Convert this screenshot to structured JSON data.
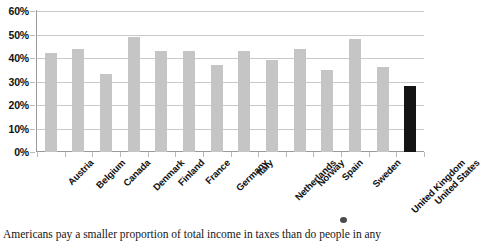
{
  "chart_data": {
    "type": "bar",
    "title": "",
    "subtitle": "",
    "xlabel": "",
    "ylabel": "",
    "ylim": [
      0,
      60
    ],
    "ytick_step": 10,
    "ytick_labels": [
      "0%",
      "10%",
      "20%",
      "30%",
      "40%",
      "50%",
      "60%"
    ],
    "grid": true,
    "legend": "none",
    "value_unit": "%",
    "categories": [
      "Austria",
      "Belgium",
      "Canada",
      "Denmark",
      "Finland",
      "France",
      "Germany",
      "Italy",
      "Netherlands",
      "Norway",
      "Spain",
      "Sweden",
      "United Kingdom",
      "United States"
    ],
    "values": [
      42,
      44,
      33,
      49,
      43,
      43,
      37,
      43,
      39,
      44,
      35,
      48,
      36,
      28
    ],
    "highlight_category": "United States",
    "colors": {
      "bar": "#c5c5c5",
      "bar_highlight": "#141414",
      "gridline": "#c9c9c9",
      "axis": "#9a9a9a",
      "text": "#111111",
      "background": "#ffffff"
    }
  },
  "caption": {
    "text": "Americans pay a smaller proportion of total income in taxes than do people in any"
  }
}
